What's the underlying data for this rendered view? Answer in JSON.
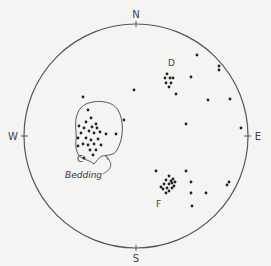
{
  "diagram": {
    "type": "stereonet",
    "compass": {
      "north": "N",
      "south": "S",
      "east": "E",
      "west": "W"
    },
    "cluster_labels": [
      "C",
      "D",
      "F"
    ],
    "annotation": "Bedding",
    "colors": {
      "ink": "#222222",
      "line": "#555555",
      "background": "#f4f4f2"
    },
    "clusters": [
      {
        "name": "C",
        "outlined": true,
        "points": [
          [
            -45,
            -18
          ],
          [
            -52,
            -8
          ],
          [
            -40,
            -12
          ],
          [
            -47,
            -5
          ],
          [
            -42,
            -3
          ],
          [
            -55,
            -3
          ],
          [
            -50,
            2
          ],
          [
            -45,
            4
          ],
          [
            -38,
            3
          ],
          [
            -53,
            8
          ],
          [
            -48,
            9
          ],
          [
            -42,
            8
          ],
          [
            -36,
            -4
          ],
          [
            -58,
            2
          ],
          [
            -44,
            -9
          ],
          [
            -39,
            -8
          ],
          [
            -50,
            -14
          ],
          [
            -35,
            9
          ],
          [
            -58,
            10
          ],
          [
            -46,
            14
          ],
          [
            -40,
            14
          ],
          [
            -30,
            -2
          ],
          [
            -48,
            -26
          ],
          [
            -52,
            22
          ],
          [
            -57,
            -10
          ],
          [
            -43,
            19
          ]
        ]
      },
      {
        "name": "D",
        "outlined": false,
        "points": [
          [
            31,
            -62
          ],
          [
            29,
            -58
          ],
          [
            34,
            -58
          ],
          [
            37,
            -58
          ],
          [
            30,
            -53
          ],
          [
            35,
            -53
          ],
          [
            33,
            -49
          ]
        ]
      },
      {
        "name": "F",
        "outlined": false,
        "points": [
          [
            33,
            40
          ],
          [
            37,
            43
          ],
          [
            30,
            44
          ],
          [
            36,
            47
          ],
          [
            39,
            46
          ],
          [
            28,
            48
          ],
          [
            33,
            48
          ],
          [
            38,
            50
          ],
          [
            31,
            52
          ],
          [
            36,
            52
          ],
          [
            27,
            53
          ],
          [
            33,
            55
          ],
          [
            30,
            57
          ],
          [
            25,
            51
          ],
          [
            35,
            45
          ]
        ]
      }
    ],
    "scattered_points": [
      [
        61,
        -81
      ],
      [
        83,
        -70
      ],
      [
        83,
        -66
      ],
      [
        55,
        -59
      ],
      [
        -2,
        -46
      ],
      [
        40,
        -42
      ],
      [
        72,
        -36
      ],
      [
        94,
        -37
      ],
      [
        -53,
        -39
      ],
      [
        50,
        -12
      ],
      [
        105,
        -8
      ],
      [
        -20,
        -2
      ],
      [
        20,
        35
      ],
      [
        50,
        35
      ],
      [
        55,
        46
      ],
      [
        93,
        46
      ],
      [
        91,
        49
      ],
      [
        55,
        57
      ],
      [
        70,
        57
      ],
      [
        56,
        70
      ],
      [
        -12,
        -16
      ]
    ]
  }
}
